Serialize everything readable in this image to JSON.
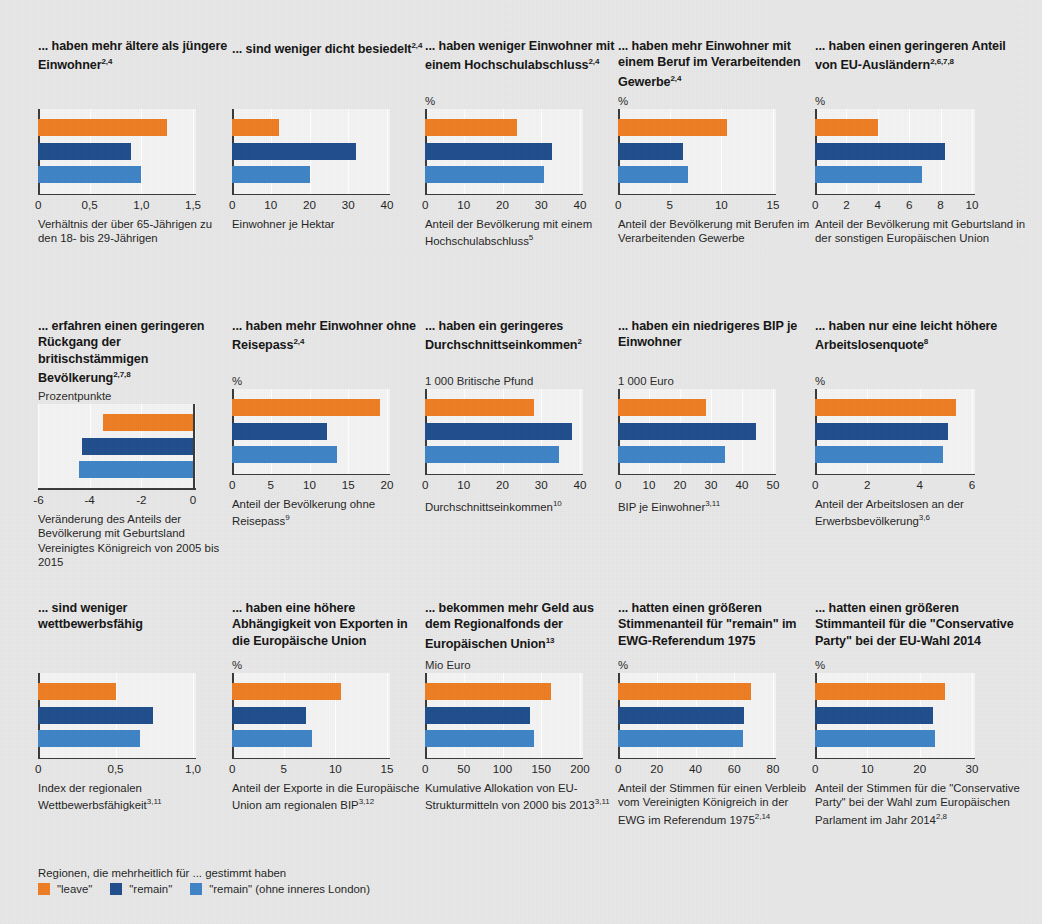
{
  "colors": {
    "leave": "#ee7d22",
    "remain": "#1f4e8c",
    "remain_excl_london": "#3f84c6",
    "background": "#e8e8e8",
    "plot_background": "#f4f4f4",
    "axis": "#3a3a3a",
    "gridline": "#ffffff"
  },
  "legend": {
    "title": "Regionen, die mehrheitlich für ... gestimmt haben",
    "items": [
      {
        "label": "\"leave\"",
        "color": "#ee7d22"
      },
      {
        "label": "\"remain\"",
        "color": "#1f4e8c"
      },
      {
        "label": "\"remain\" (ohne inneres London)",
        "color": "#3f84c6"
      }
    ]
  },
  "series_names": [
    "\"leave\"",
    "\"remain\"",
    "\"remain\" (ohne inneres London)"
  ],
  "chart_data": [
    {
      "id": "chart-age-ratio",
      "type": "bar",
      "orientation": "horizontal",
      "title": "... haben mehr ältere als jüngere Einwohner",
      "title_sup": "2,4",
      "unit": "",
      "categories": [
        "\"leave\"",
        "\"remain\"",
        "\"remain\" (ohne inneres London)"
      ],
      "values": [
        1.25,
        0.9,
        1.0
      ],
      "xlim": [
        0,
        1.5
      ],
      "ticks": [
        0,
        0.5,
        1.0,
        1.5
      ],
      "tick_labels": [
        "0",
        "0,5",
        "1,0",
        "1,5"
      ],
      "caption": "Verhältnis der über 65-Jährigen zu den 18- bis 29-Jährigen",
      "caption_sup": "",
      "grid": true
    },
    {
      "id": "chart-density",
      "type": "bar",
      "orientation": "horizontal",
      "title": "... sind weniger dicht besiedelt",
      "title_sup": "2,4",
      "unit": "",
      "categories": [
        "\"leave\"",
        "\"remain\"",
        "\"remain\" (ohne inneres London)"
      ],
      "values": [
        12.2,
        32.0,
        20.2
      ],
      "xlim": [
        0,
        40
      ],
      "ticks": [
        0,
        10,
        20,
        30,
        40
      ],
      "tick_labels": [
        "0",
        "10",
        "20",
        "30",
        "40"
      ],
      "caption": "Einwohner je Hektar",
      "caption_sup": "",
      "grid": true
    },
    {
      "id": "chart-higher-education",
      "type": "bar",
      "orientation": "horizontal",
      "title": "... haben weniger Einwohner mit einem Hochschulabschluss",
      "title_sup": "2,4",
      "unit": "%",
      "categories": [
        "\"leave\"",
        "\"remain\"",
        "\"remain\" (ohne inneres London)"
      ],
      "values": [
        23.8,
        32.8,
        30.6
      ],
      "xlim": [
        0,
        40
      ],
      "ticks": [
        0,
        10,
        20,
        30,
        40
      ],
      "tick_labels": [
        "0",
        "10",
        "20",
        "30",
        "40"
      ],
      "caption": "Anteil der Bevölkerung mit einem Hochschulabschluss",
      "caption_sup": "5",
      "grid": true
    },
    {
      "id": "chart-manufacturing",
      "type": "bar",
      "orientation": "horizontal",
      "title": "... haben mehr Einwohner mit einem Beruf im Verarbeitenden Gewerbe",
      "title_sup": "2,4",
      "unit": "%",
      "categories": [
        "\"leave\"",
        "\"remain\"",
        "\"remain\" (ohne inneres London)"
      ],
      "values": [
        10.5,
        6.3,
        6.8
      ],
      "xlim": [
        0,
        15
      ],
      "ticks": [
        0,
        5,
        10,
        15
      ],
      "tick_labels": [
        "0",
        "5",
        "10",
        "15"
      ],
      "caption": "Anteil der Bevölkerung mit Berufen im Verarbeitenden Gewerbe",
      "caption_sup": "",
      "grid": true
    },
    {
      "id": "chart-eu-foreigners",
      "type": "bar",
      "orientation": "horizontal",
      "title": "... haben einen geringeren Anteil von EU-Ausländern",
      "title_sup": "2,6,7,8",
      "unit": "%",
      "categories": [
        "\"leave\"",
        "\"remain\"",
        "\"remain\" (ohne inneres London)"
      ],
      "values": [
        4.0,
        8.3,
        6.8
      ],
      "xlim": [
        0,
        10
      ],
      "ticks": [
        0,
        2,
        4,
        6,
        8,
        10
      ],
      "tick_labels": [
        "0",
        "2",
        "4",
        "6",
        "8",
        "10"
      ],
      "caption": "Anteil der Bevölkerung mit Geburtsland in der sonstigen Europäischen Union",
      "caption_sup": "",
      "grid": true
    },
    {
      "id": "chart-british-born-decline",
      "type": "bar",
      "orientation": "horizontal",
      "title": "... erfahren einen geringeren Rückgang der britischstämmigen Bevölkerung",
      "title_sup": "2,7,8",
      "unit": "Prozentpunkte",
      "categories": [
        "\"leave\"",
        "\"remain\"",
        "\"remain\" (ohne inneres London)"
      ],
      "values": [
        -3.5,
        -4.3,
        -4.4
      ],
      "xlim": [
        -6,
        0
      ],
      "ticks": [
        -6,
        -4,
        -2,
        0
      ],
      "tick_labels": [
        "-6",
        "-4",
        "-2",
        "0"
      ],
      "caption": "Veränderung des Anteils der Bevölkerung mit Geburtsland Vereinigtes Königreich von 2005 bis 2015",
      "caption_sup": "",
      "grid": true
    },
    {
      "id": "chart-no-passport",
      "type": "bar",
      "orientation": "horizontal",
      "title": "... haben mehr Einwohner ohne Reisepass",
      "title_sup": "2,4",
      "unit": "%",
      "categories": [
        "\"leave\"",
        "\"remain\"",
        "\"remain\" (ohne inneres London)"
      ],
      "values": [
        19.1,
        12.3,
        13.5
      ],
      "xlim": [
        0,
        20
      ],
      "ticks": [
        0,
        5,
        10,
        15,
        20
      ],
      "tick_labels": [
        "0",
        "5",
        "10",
        "15",
        "20"
      ],
      "caption": "Anteil der Bevölkerung ohne Reisepass",
      "caption_sup": "9",
      "grid": true
    },
    {
      "id": "chart-average-income",
      "type": "bar",
      "orientation": "horizontal",
      "title": "... haben ein geringeres Durchschnittseinkommen",
      "title_sup": "2",
      "unit": "1 000 Britische Pfund",
      "categories": [
        "\"leave\"",
        "\"remain\"",
        "\"remain\" (ohne inneres London)"
      ],
      "values": [
        28.0,
        38.0,
        34.5
      ],
      "xlim": [
        0,
        40
      ],
      "ticks": [
        0,
        10,
        20,
        30,
        40
      ],
      "tick_labels": [
        "0",
        "10",
        "20",
        "30",
        "40"
      ],
      "caption": "Durchschnittseinkommen",
      "caption_sup": "10",
      "grid": true
    },
    {
      "id": "chart-gdp-per-capita",
      "type": "bar",
      "orientation": "horizontal",
      "title": "... haben ein niedrigeres BIP je Einwohner",
      "title_sup": "",
      "unit": "1 000 Euro",
      "categories": [
        "\"leave\"",
        "\"remain\"",
        "\"remain\" (ohne inneres London)"
      ],
      "values": [
        28.5,
        44.5,
        34.5
      ],
      "xlim": [
        0,
        50
      ],
      "ticks": [
        0,
        10,
        20,
        30,
        40,
        50
      ],
      "tick_labels": [
        "0",
        "10",
        "20",
        "30",
        "40",
        "50"
      ],
      "caption": "BIP je Einwohner",
      "caption_sup": "3,11",
      "grid": true
    },
    {
      "id": "chart-unemployment",
      "type": "bar",
      "orientation": "horizontal",
      "title": "... haben nur eine leicht höhere Arbeitslosenquote",
      "title_sup": "8",
      "unit": "%",
      "categories": [
        "\"leave\"",
        "\"remain\"",
        "\"remain\" (ohne inneres London)"
      ],
      "values": [
        5.4,
        5.1,
        4.9
      ],
      "xlim": [
        0,
        6
      ],
      "ticks": [
        0,
        2,
        4,
        6
      ],
      "tick_labels": [
        "0",
        "2",
        "4",
        "6"
      ],
      "caption": "Anteil der Arbeitslosen an der Erwerbsbevölkerung",
      "caption_sup": "3,6",
      "grid": true
    },
    {
      "id": "chart-competitiveness",
      "type": "bar",
      "orientation": "horizontal",
      "title": "... sind weniger wettbewerbsfähig",
      "title_sup": "",
      "unit": "",
      "categories": [
        "\"leave\"",
        "\"remain\"",
        "\"remain\" (ohne inneres London)"
      ],
      "values": [
        0.5,
        0.745,
        0.66
      ],
      "xlim": [
        0,
        1.0
      ],
      "ticks": [
        0,
        0.5,
        1.0
      ],
      "tick_labels": [
        "0",
        "0,5",
        "1,0"
      ],
      "caption": "Index der regionalen Wettbewerbsfähigkeit",
      "caption_sup": "3,11",
      "grid": true
    },
    {
      "id": "chart-eu-exports",
      "type": "bar",
      "orientation": "horizontal",
      "title": "... haben eine höhere Abhängigkeit von Exporten in die Europäische Union",
      "title_sup": "",
      "unit": "%",
      "categories": [
        "\"leave\"",
        "\"remain\"",
        "\"remain\" (ohne inneres London)"
      ],
      "values": [
        10.5,
        7.2,
        7.7
      ],
      "xlim": [
        0,
        15
      ],
      "ticks": [
        0,
        5,
        10,
        15
      ],
      "tick_labels": [
        "0",
        "5",
        "10",
        "15"
      ],
      "caption": "Anteil der Exporte in die Europäische Union am regionalen BIP",
      "caption_sup": "3,12",
      "grid": true
    },
    {
      "id": "chart-regional-funds",
      "type": "bar",
      "orientation": "horizontal",
      "title": "... bekommen mehr Geld aus dem Regionalfonds der Europäischen Union",
      "title_sup": "13",
      "unit": "Mio Euro",
      "categories": [
        "\"leave\"",
        "\"remain\"",
        "\"remain\" (ohne inneres London)"
      ],
      "values": [
        162,
        136,
        140
      ],
      "xlim": [
        0,
        200
      ],
      "ticks": [
        0,
        50,
        100,
        150,
        200
      ],
      "tick_labels": [
        "0",
        "50",
        "100",
        "150",
        "200"
      ],
      "caption": "Kumulative Allokation von EU-Strukturmitteln von 2000 bis 2013",
      "caption_sup": "3,11",
      "grid": true
    },
    {
      "id": "chart-ewg-referendum-1975",
      "type": "bar",
      "orientation": "horizontal",
      "title": "... hatten einen größeren Stimmenanteil für \"remain\" im EWG-Referendum 1975",
      "title_sup": "",
      "unit": "%",
      "categories": [
        "\"leave\"",
        "\"remain\"",
        "\"remain\" (ohne inneres London)"
      ],
      "values": [
        68.5,
        65.0,
        64.5
      ],
      "xlim": [
        0,
        80
      ],
      "ticks": [
        0,
        20,
        40,
        60,
        80
      ],
      "tick_labels": [
        "0",
        "20",
        "40",
        "60",
        "80"
      ],
      "caption": "Anteil der Stimmen für einen Verbleib vom Vereinigten Königreich in der EWG im Referendum 1975",
      "caption_sup": "2,14",
      "grid": true
    },
    {
      "id": "chart-eu-election-2014",
      "type": "bar",
      "orientation": "horizontal",
      "title": "... hatten einen größeren Stimmanteil für die \"Conservative Party\" bei der EU-Wahl 2014",
      "title_sup": "",
      "unit": "%",
      "categories": [
        "\"leave\"",
        "\"remain\"",
        "\"remain\" (ohne inneres London)"
      ],
      "values": [
        24.8,
        22.5,
        23.0
      ],
      "xlim": [
        0,
        30
      ],
      "ticks": [
        0,
        10,
        20,
        30
      ],
      "tick_labels": [
        "0",
        "10",
        "20",
        "30"
      ],
      "caption": "Anteil der Stimmen für die \"Conservative Party\" bei der Wahl zum Europäischen Parlament im Jahr 2014",
      "caption_sup": "2,8",
      "grid": true
    }
  ]
}
